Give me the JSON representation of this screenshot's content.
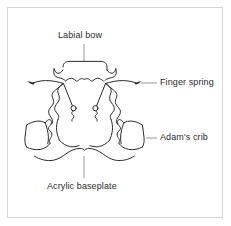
{
  "figure": {
    "background_color": "#ffffff",
    "frame_color": "#d6d6d6",
    "ink_color": "#2b2b2b",
    "leader_color": "#8c8c8c",
    "labels": {
      "labial_bow": "Labial bow",
      "finger_spring": "Finger spring",
      "adams_crib": "Adam's crib",
      "acrylic_baseplate": "Acrylic baseplate"
    }
  }
}
